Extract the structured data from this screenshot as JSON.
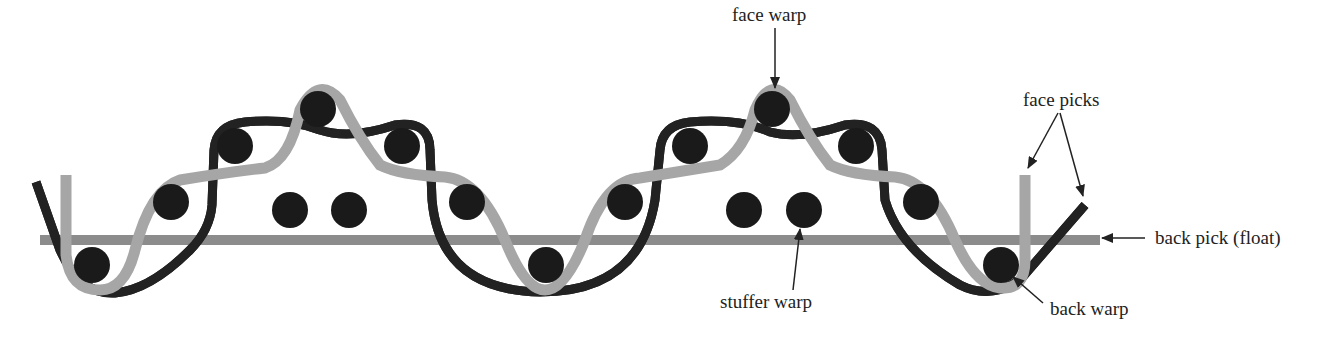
{
  "diagram": {
    "type": "woven fabric cross-section",
    "colors": {
      "face_warp": "#a6a6a6",
      "back_pick": "#8c8c8c",
      "picks": "#1a1a1a",
      "back_warp_outline": "#222222",
      "label": "#222222"
    },
    "labels": {
      "face_warp": "face warp",
      "face_picks": "face picks",
      "back_pick": "back pick (float)",
      "stuffer_warp": "stuffer warp",
      "back_warp": "back warp"
    }
  }
}
